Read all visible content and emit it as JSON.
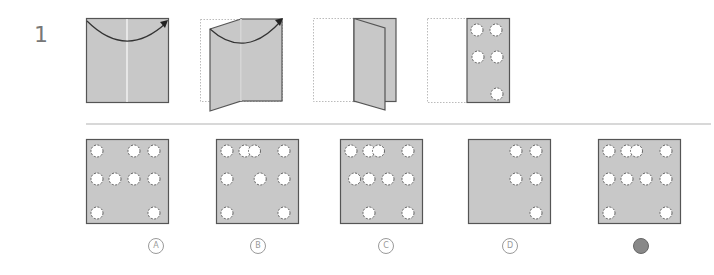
{
  "question": {
    "number": "1",
    "colors": {
      "paper": "#c8c8c8",
      "paper_edge": "#555555",
      "hole_fill": "#ffffff",
      "hole_stroke": "#555555",
      "outline_dotted": "#999999",
      "crease": "#f2f2f2",
      "arrow": "#333333"
    },
    "steps": [
      {
        "name": "fold-right-over-left-start",
        "description": "Square paper with vertical crease; arrow curving from left edge to right"
      },
      {
        "name": "folding-in-progress",
        "description": "Left half lifting over to the right"
      },
      {
        "name": "folded-in-half",
        "description": "Paper folded; left half outline dotted"
      },
      {
        "name": "punched-holes",
        "description": "Folded paper with 5 holes punched"
      }
    ],
    "punched_holes": [
      [
        0,
        0
      ],
      [
        1,
        0
      ],
      [
        0,
        1
      ],
      [
        1,
        1
      ],
      [
        1,
        2
      ]
    ]
  },
  "options": [
    {
      "letter": "A",
      "label": "A",
      "selected": false,
      "holes": [
        [
          0,
          0
        ],
        [
          2,
          0
        ],
        [
          3,
          0
        ],
        [
          0,
          1
        ],
        [
          1,
          1
        ],
        [
          2,
          1
        ],
        [
          3,
          1
        ],
        [
          0,
          2
        ],
        [
          3,
          2
        ]
      ]
    },
    {
      "letter": "B",
      "label": "B",
      "selected": false,
      "holes": [
        [
          0,
          0
        ],
        [
          1,
          0
        ],
        [
          1.5,
          0
        ],
        [
          3,
          0
        ],
        [
          0,
          1
        ],
        [
          1.8,
          1
        ],
        [
          3,
          1
        ],
        [
          0,
          2
        ],
        [
          3,
          2
        ]
      ]
    },
    {
      "letter": "C",
      "label": "C",
      "selected": false,
      "holes": [
        [
          0,
          0
        ],
        [
          1,
          0
        ],
        [
          1.5,
          0
        ],
        [
          3,
          0
        ],
        [
          0.2,
          1
        ],
        [
          1,
          1
        ],
        [
          2,
          1
        ],
        [
          3,
          1
        ],
        [
          1,
          2
        ],
        [
          3,
          2
        ]
      ]
    },
    {
      "letter": "D",
      "label": "D",
      "selected": false,
      "holes": [
        [
          2,
          0
        ],
        [
          3,
          0
        ],
        [
          2,
          1
        ],
        [
          3,
          1
        ],
        [
          3,
          2
        ]
      ]
    },
    {
      "letter": "E",
      "label": "E",
      "selected": true,
      "holes": [
        [
          0,
          0
        ],
        [
          1,
          0
        ],
        [
          1.5,
          0
        ],
        [
          3,
          0
        ],
        [
          0,
          1
        ],
        [
          1,
          1
        ],
        [
          2,
          1
        ],
        [
          3,
          1
        ],
        [
          0,
          2
        ],
        [
          3,
          2
        ]
      ]
    }
  ]
}
